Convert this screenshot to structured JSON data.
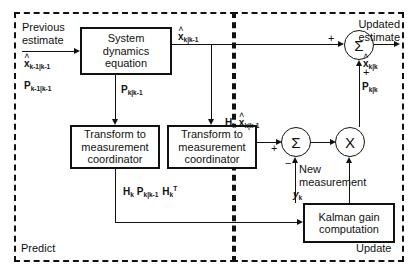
{
  "diagram": {
    "regions": [
      {
        "name": "predict",
        "label": "Predict"
      },
      {
        "name": "update",
        "label": "Update"
      }
    ],
    "blocks": [
      {
        "name": "system-dynamics",
        "label": "System dynamics equation"
      },
      {
        "name": "transform-left",
        "label": "Transform to measurement coordinator"
      },
      {
        "name": "transform-right",
        "label": "Transform to measurement coordinator"
      },
      {
        "name": "kalman-gain",
        "label": "Kalman gain computation"
      }
    ],
    "nodes": [
      {
        "name": "sum-output",
        "glyph": "Σ"
      },
      {
        "name": "sum-innovation",
        "glyph": "Σ"
      },
      {
        "name": "multiply",
        "glyph": "X"
      }
    ],
    "labels": {
      "previous_estimate": "Previous estimate",
      "updated_estimate": "Updated estimate",
      "new_measurement": "New measurement"
    },
    "signs": {
      "sum_output_left": "+",
      "sum_output_bottom": "+",
      "sum_innovation_top": "+",
      "sum_innovation_bottom": "−"
    },
    "math": {
      "x_prev": {
        "base": "x",
        "hat": "˄",
        "sub": "k-1|k-1"
      },
      "p_prev": {
        "base": "P",
        "sub": "k-1|k-1"
      },
      "p_pred": {
        "base": "P",
        "sub": "k|k-1"
      },
      "x_pred": {
        "base": "x",
        "hat": "˄",
        "sub": "k|k-1"
      },
      "x_upd": {
        "base": "x",
        "hat": "˄",
        "sub": "k|k"
      },
      "p_upd": {
        "base": "P",
        "sub": "k|k"
      },
      "hx_pred": {
        "h": "H",
        "h_sub": "k",
        "base": "x",
        "hat": "˄",
        "sub": "k|k-1"
      },
      "hph": {
        "h1": "H",
        "h1_sub": "k",
        "p": "P",
        "p_sub": "k|k-1",
        "h2": "H",
        "h2_sub": "k",
        "h2_sup": "T"
      },
      "y_meas": {
        "base": "y",
        "sub": "k"
      }
    },
    "colors": {
      "line": "#111111",
      "background": "#ffffff",
      "border": "#111111"
    }
  }
}
